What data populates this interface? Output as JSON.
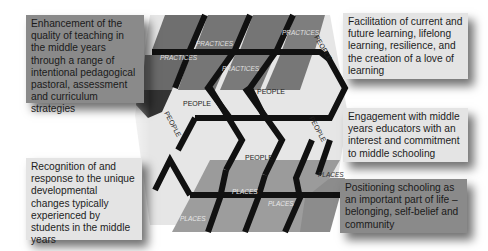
{
  "boxes": {
    "top_left": "Enhancement of the quality of teaching in the middle years through a range of intentional pedagogical pastoral, assessment and curriculum strategies",
    "top_right": "Facilitation of current and future learning, lifelong learning, resilience, and the creation of a love of learning",
    "middle_right": "Engagement with middle years educators with an interest and commitment to middle schooling",
    "bottom_right": "Positioning schooling as an important part of life – belonging, self-belief and community",
    "bottom_left": "Recognition of and response to the unique developmental changes typically experienced by students in the middle years"
  },
  "diagram": {
    "practices_labels": [
      "PRACTICES",
      "PRACTICES",
      "PRACTICES",
      "PRACTICES"
    ],
    "people_labels": [
      "PEOPLE",
      "PEOPLE",
      "PEOPLE",
      "PEOPLE",
      "PEOPLE",
      "PEOPLE"
    ],
    "places_labels": [
      "PLACES",
      "PLACES",
      "PLACES",
      "PLACES"
    ],
    "colors": {
      "practices_face": "#777777",
      "places_face": "#9a9a9a",
      "people_face": "#e8e8e8",
      "strand": "#111111"
    }
  }
}
